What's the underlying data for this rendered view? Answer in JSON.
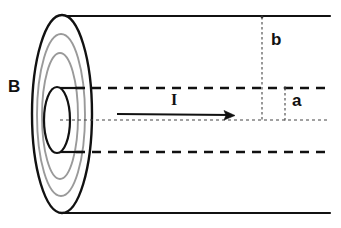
{
  "figure": {
    "width": 341,
    "height": 228,
    "background_color": "#ffffff"
  },
  "labels": {
    "magnetic_field": "B",
    "current": "I",
    "inner_radius": "a",
    "outer_radius": "b"
  },
  "colors": {
    "outline": "#111111",
    "field_line": "#9a9a9a",
    "dashed": "#111111",
    "dotted": "#555555",
    "background": "#ffffff"
  },
  "geometry": {
    "cylinder": {
      "top_edge_y": 16,
      "bottom_edge_y": 213,
      "right_edge_x": 330,
      "face_center_x": 62,
      "face_center_y": 114,
      "outer_ellipse_rx": 30,
      "outer_ellipse_ry": 99
    },
    "field_lines": [
      {
        "rx": 24,
        "ry": 80
      },
      {
        "rx": 18,
        "ry": 62
      }
    ],
    "inner_conductor": {
      "center_x": 57,
      "center_y": 120,
      "rx": 13,
      "ry": 33
    },
    "axis_y": 120,
    "dashed_top_y": 88,
    "dashed_bottom_y": 152,
    "radius_b_line_x": 262,
    "radius_a_line_x": 285,
    "current_arrow": {
      "start_x": 117,
      "end_x": 235,
      "y": 115
    }
  },
  "elements": {
    "outer_cylinder_name": "outer-cylinder-shell",
    "inner_cylinder_name": "inner-conductor",
    "field_lines_name": "magnetic-field-lines",
    "axis_name": "central-axis",
    "current_arrow_name": "current-direction-arrow"
  }
}
